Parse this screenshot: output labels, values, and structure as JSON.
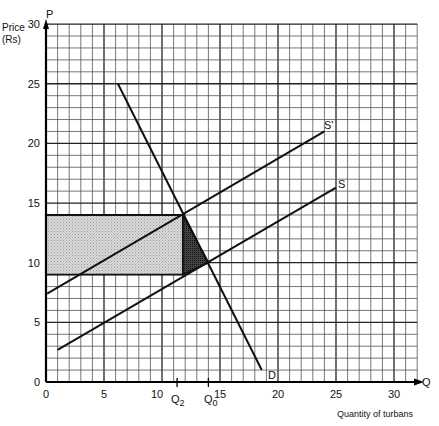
{
  "chart_data": {
    "type": "line",
    "title": "",
    "caption": "",
    "xlabel": "Quantity of turbans",
    "ylabel": "Price (Rs)",
    "x_axis_symbol": "Q",
    "y_axis_symbol": "P",
    "xlim": [
      0,
      32
    ],
    "ylim": [
      0,
      30
    ],
    "x_ticks": [
      0,
      5,
      10,
      15,
      20,
      25,
      30
    ],
    "y_ticks": [
      0,
      5,
      10,
      15,
      20,
      25,
      30
    ],
    "grid": {
      "on": true,
      "minor_step": 1,
      "major_step": 5
    },
    "special_x_ticks": [
      {
        "label": "Q",
        "sub": "2",
        "x": 11.3
      },
      {
        "label": "Q",
        "sub": "0",
        "x": 14.0
      }
    ],
    "series": [
      {
        "name": "D",
        "label": "D",
        "points": [
          [
            6.2,
            25
          ],
          [
            18.6,
            1
          ]
        ]
      },
      {
        "name": "S",
        "label": "S",
        "points": [
          [
            1,
            2.7
          ],
          [
            25,
            16.3
          ]
        ]
      },
      {
        "name": "S'",
        "label": "S'",
        "points": [
          [
            0.1,
            7.4
          ],
          [
            24,
            21
          ]
        ]
      }
    ],
    "shaded_regions": [
      {
        "name": "tax-revenue-rectangle",
        "shade": "light",
        "polygon": [
          [
            0,
            9
          ],
          [
            11.8,
            9
          ],
          [
            11.8,
            14
          ],
          [
            0,
            14
          ]
        ]
      },
      {
        "name": "deadweight-loss-triangle",
        "shade": "dark",
        "polygon": [
          [
            11.8,
            14
          ],
          [
            11.8,
            9
          ],
          [
            14,
            10
          ]
        ]
      }
    ],
    "equilibria": [
      {
        "name": "original",
        "q": 14,
        "p": 10
      },
      {
        "name": "after-tax",
        "q": 11.8,
        "p": 14
      }
    ]
  },
  "labels": {
    "y_title_line1": "Price",
    "y_title_line2": "(Rs)",
    "y_symbol": "P",
    "x_symbol": "Q",
    "x_title": "Quantity of turbans",
    "q2_main": "Q",
    "q2_sub": "2",
    "q0_main": "Q",
    "q0_sub": "0",
    "curve_d": "D",
    "curve_s": "S",
    "curve_s_prime": "S'"
  }
}
